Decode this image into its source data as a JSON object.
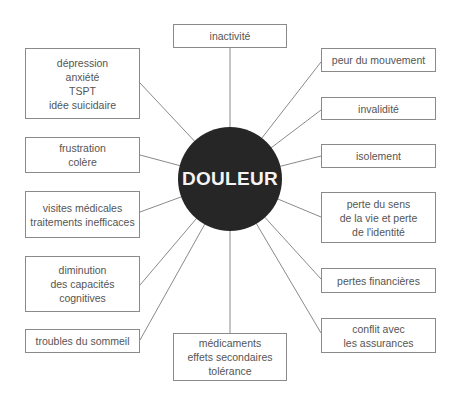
{
  "center": {
    "label": "DOULEUR",
    "color": "#262626"
  },
  "colors": {
    "line": "#8a8a8a",
    "border": "#8a8a8a",
    "text": "#555555"
  },
  "nodes": {
    "inactivite": {
      "lines": [
        "inactivité"
      ]
    },
    "depression": {
      "lines": [
        "dépression",
        "anxiété",
        "TSPT",
        "idée suicidaire"
      ]
    },
    "frustration": {
      "lines": [
        "frustration",
        "colère"
      ]
    },
    "visites": {
      "lines": [
        "visites médicales",
        "traitements inefficaces"
      ]
    },
    "diminution": {
      "lines": [
        "diminution",
        "des capacités",
        "cognitives"
      ]
    },
    "troubles": {
      "lines": [
        "troubles du sommeil"
      ]
    },
    "medicaments": {
      "lines": [
        "médicaments",
        "effets secondaires",
        "tolérance"
      ]
    },
    "peur": {
      "lines": [
        "peur du mouvement"
      ]
    },
    "invalidite": {
      "lines": [
        "invalidité"
      ]
    },
    "isolement": {
      "lines": [
        "isolement"
      ]
    },
    "perte_sens": {
      "lines": [
        "perte du sens",
        "de la vie et perte",
        "de l'identité"
      ]
    },
    "pertes_financieres": {
      "lines": [
        "pertes financières"
      ]
    },
    "conflit": {
      "lines": [
        "conflit avec",
        "les assurances"
      ]
    }
  }
}
